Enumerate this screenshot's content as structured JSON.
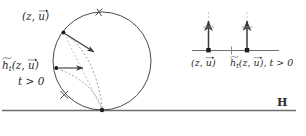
{
  "figure": {
    "background_color": "#ffffff",
    "stroke_color": "#3a3a3a",
    "dashed_color": "#8f8f8f",
    "text_color": "#2b2b2b"
  },
  "left_panel": {
    "name": "horocycle-circle-diagram",
    "circle": {
      "center_x": 102,
      "center_y": 61,
      "radius": 49,
      "tangent_point_x": 102,
      "tangent_point_y": 110
    },
    "points": [
      {
        "id": "point-z-u",
        "x": 63,
        "y": 32,
        "label_latex": "(z, u)",
        "label_text": "(z, u⃗)"
      },
      {
        "id": "point-ht-z-u",
        "x": 56,
        "y": 68,
        "label_latex": "h_t(z, u)",
        "label_text": "h̃t(z, u⃗)"
      }
    ],
    "labels": {
      "z_u": {
        "open_paren": "(",
        "z": "z",
        "comma": ", ",
        "u": "u",
        "close_paren": ")"
      },
      "ht_z_u": {
        "h": "h",
        "t_sub": "t",
        "open_paren": "(",
        "z": "z",
        "comma": ", ",
        "u": "u",
        "close_paren": ")"
      },
      "t_positive": "t > 0"
    },
    "tick_marks_on_circle": [
      {
        "id": "tick-top-right",
        "x": 99,
        "y": 12
      },
      {
        "id": "tick-lower-left",
        "x": 64,
        "y": 95
      }
    ],
    "direction_arrows": [
      {
        "id": "arrow-from-z-u",
        "from_x": 65,
        "from_y": 34,
        "to_x": 95,
        "to_y": 53
      },
      {
        "id": "arrow-from-ht-z-u",
        "from_x": 58,
        "from_y": 68,
        "to_x": 84,
        "to_y": 68
      }
    ]
  },
  "right_panel": {
    "name": "boundary-axis-diagram",
    "axis": {
      "x_start": 192,
      "x_end": 279,
      "y": 50
    },
    "arrows": [
      {
        "id": "axis-arrow-z-u",
        "x": 208,
        "base_y": 50,
        "tip_y": 20,
        "label_text": "(z, u⃗)"
      },
      {
        "id": "axis-arrow-ht-z-u",
        "x": 247,
        "base_y": 50,
        "tip_y": 20,
        "label_text": "h̃t(z, u⃗), t > 0"
      }
    ],
    "axis_tick": {
      "id": "axis-mid-tick",
      "x": 231,
      "y": 50
    },
    "labels": {
      "z_u": {
        "open_paren": "(",
        "z": "z",
        "comma": ", ",
        "u": "u",
        "close_paren": ")"
      },
      "ht_z_u_t": {
        "h": "h",
        "t_sub": "t",
        "open_paren": "(",
        "z": "z",
        "comma": ", ",
        "u": "u",
        "close_paren": ")",
        "suffix": ", t > 0"
      }
    }
  },
  "baseline": {
    "name": "boundary-line-H",
    "y": 110,
    "x_start": 2,
    "x_end": 296,
    "label": "H"
  }
}
